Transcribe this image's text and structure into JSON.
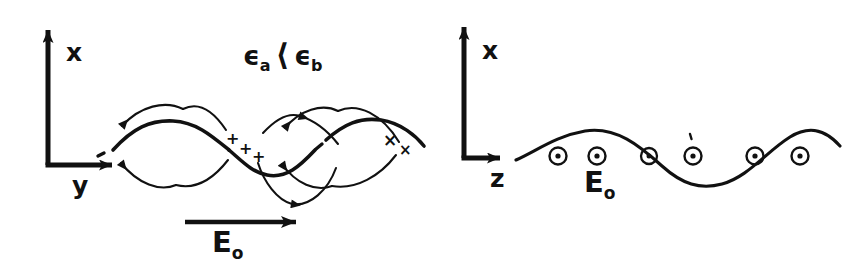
{
  "figure": {
    "stroke_color": "#111111",
    "background_color": "#ffffff",
    "width": 847,
    "height": 264
  },
  "panels": [
    {
      "id": "left",
      "view": "x-y plane",
      "axes": {
        "vertical_label": "x",
        "horizontal_label": "y",
        "origin_x": 48,
        "origin_y": 165,
        "vertical_tip_y": 22,
        "horizontal_tip_x": 120
      },
      "condition_label": {
        "base_a": "ϵ",
        "sub_a": "a",
        "relation": "⟨",
        "base_b": "ϵ",
        "sub_b": "b",
        "text": "ϵa ⟨ ϵb"
      },
      "field_label": {
        "base": "E",
        "sub": "o",
        "text": "Eo"
      },
      "field_arrow": {
        "direction": "right",
        "x_start": 185,
        "x_end": 300,
        "y": 222
      },
      "interface": {
        "type": "sine",
        "amplitude": 26,
        "wavelength": 152,
        "baseline_y": 148,
        "x_start": 98,
        "x_end": 424,
        "phase_deg": 0,
        "line_weight": "thick",
        "dashed_gaps": true
      },
      "field_loops": [
        {
          "position": "upper-left",
          "arrow_direction": "left"
        },
        {
          "position": "lower-left",
          "arrow_direction": "left"
        },
        {
          "position": "upper-middle",
          "arrow_direction": "right"
        },
        {
          "position": "lower-middle",
          "arrow_direction": "right"
        },
        {
          "position": "upper-right",
          "arrow_direction": "left"
        },
        {
          "position": "lower-right",
          "arrow_direction": "left"
        }
      ],
      "surface_charges": [
        {
          "symbol": "+",
          "x": 231,
          "y": 140
        },
        {
          "symbol": "+",
          "x": 244,
          "y": 150
        },
        {
          "symbol": "+",
          "x": 257,
          "y": 158
        },
        {
          "symbol": "×",
          "x": 388,
          "y": 141
        },
        {
          "symbol": "×",
          "x": 404,
          "y": 152
        }
      ]
    },
    {
      "id": "right",
      "view": "x-z plane",
      "axes": {
        "vertical_label": "x",
        "horizontal_label": "z",
        "origin_x": 464,
        "origin_y": 158,
        "vertical_tip_y": 22,
        "horizontal_tip_x": 508
      },
      "field_label": {
        "base": "E",
        "sub": "o",
        "text": "Eo"
      },
      "interface": {
        "type": "sine",
        "amplitude": 26,
        "wavelength": 240,
        "baseline_y": 158,
        "x_start": 516,
        "x_end": 840,
        "line_weight": "thin"
      },
      "out_of_page_markers": {
        "symbol": "⊙",
        "count": 6,
        "y": 156,
        "x_positions": [
          558,
          597,
          649,
          693,
          755,
          800
        ]
      }
    }
  ]
}
